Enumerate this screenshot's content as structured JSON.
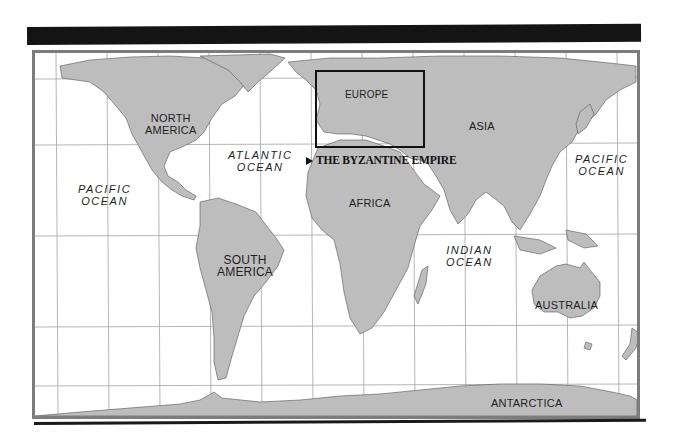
{
  "map": {
    "title_bar_color": "#141414",
    "land_color": "#bdbdbd",
    "water_color": "#ffffff",
    "grid_color": "#a0a0a0",
    "frame_color": "#7c7c7c",
    "continents": {
      "north_america": "NORTH\nAMERICA",
      "south_america": "SOUTH\nAMERICA",
      "europe": "EUROPE",
      "asia": "ASIA",
      "africa": "AFRICA",
      "australia": "AUSTRALIA",
      "antarctica": "ANTARCTICA"
    },
    "oceans": {
      "pacific_west": "PACIFIC\nOCEAN",
      "atlantic": "ATLANTIC\nOCEAN",
      "indian": "INDIAN\nOCEAN",
      "pacific_east": "PACIFIC\nOCEAN"
    },
    "callout": {
      "label": "THE BYZANTINE EMPIRE",
      "icon": "triangle-pointer-icon"
    }
  }
}
